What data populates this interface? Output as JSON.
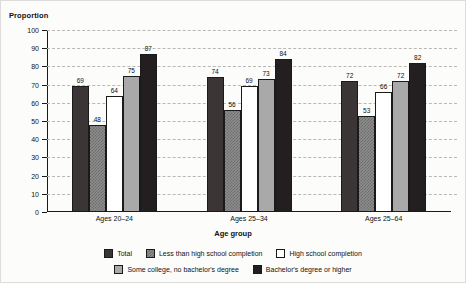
{
  "chart_data": {
    "type": "bar",
    "title": "",
    "ylabel": "Proportion",
    "xlabel": "Age group",
    "ylim": [
      0,
      100
    ],
    "yticks": [
      100,
      90,
      80,
      70,
      60,
      50,
      40,
      30,
      20,
      10,
      0
    ],
    "grid": true,
    "legend_position": "bottom",
    "categories": [
      "Ages 20–24",
      "Ages 25–34",
      "Ages 25–64"
    ],
    "series": [
      {
        "name": "Total",
        "fill": "f-total",
        "color": "#3b3535",
        "values": [
          69,
          74,
          72
        ]
      },
      {
        "name": "Less than high school completion",
        "fill": "f-lths",
        "color": "#8d8d8d",
        "values": [
          48,
          56,
          53
        ]
      },
      {
        "name": "High school completion",
        "fill": "f-hs",
        "color": "#ffffff",
        "values": [
          64,
          69,
          66
        ]
      },
      {
        "name": "Some college, no bachelor's degree",
        "fill": "f-somecol",
        "color": "#a9a9a9",
        "values": [
          75,
          73,
          72
        ]
      },
      {
        "name": "Bachelor's degree or higher",
        "fill": "f-bach",
        "color": "#231f20",
        "values": [
          87,
          84,
          82
        ]
      }
    ]
  }
}
